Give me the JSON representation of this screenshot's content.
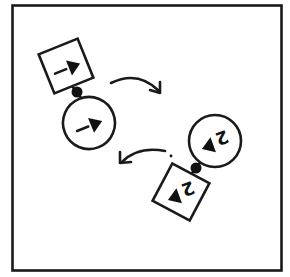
{
  "diagram": {
    "frame": {
      "x": 12,
      "y": 5,
      "width": 269,
      "height": 265,
      "stroke": "#1a1a1a"
    },
    "ink_color": "#1a1a1a",
    "background": "#ffffff",
    "units": [
      {
        "id": "unit-1",
        "label": "1",
        "square": {
          "cx": 66,
          "cy": 66,
          "size": 44,
          "rotation": -22,
          "label": "1"
        },
        "connector": {
          "cx": 77,
          "cy": 92,
          "r": 5
        },
        "circle": {
          "cx": 89,
          "cy": 123,
          "r": 26,
          "label": "1"
        },
        "glyph_rotation": -22
      },
      {
        "id": "unit-2",
        "label": "2",
        "square": {
          "cx": 181,
          "cy": 192,
          "size": 44,
          "rotation": 28,
          "label": "2"
        },
        "connector": {
          "cx": 196,
          "cy": 168,
          "r": 5
        },
        "circle": {
          "cx": 215,
          "cy": 141,
          "r": 26,
          "label": "2"
        },
        "glyph_rotation": 160
      }
    ],
    "arrows": [
      {
        "id": "arrow-clockwise-top",
        "direction": "right",
        "from": [
          111,
          83
        ],
        "to": [
          160,
          93
        ]
      },
      {
        "id": "arrow-counter-bottom",
        "direction": "left",
        "from": [
          165,
          150
        ],
        "to": [
          120,
          163
        ]
      }
    ]
  }
}
